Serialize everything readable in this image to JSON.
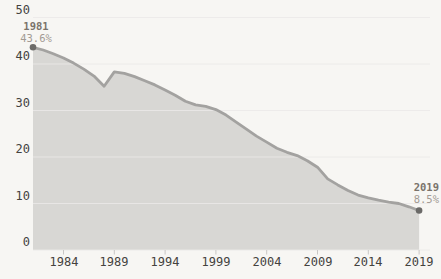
{
  "chart_data": {
    "type": "area",
    "x": [
      1981,
      1982,
      1983,
      1984,
      1985,
      1986,
      1987,
      1988,
      1989,
      1990,
      1991,
      1992,
      1993,
      1994,
      1995,
      1996,
      1997,
      1998,
      1999,
      2000,
      2001,
      2002,
      2003,
      2004,
      2005,
      2006,
      2007,
      2008,
      2009,
      2010,
      2011,
      2012,
      2013,
      2014,
      2015,
      2016,
      2017,
      2018,
      2019
    ],
    "values": [
      43.6,
      43.0,
      42.2,
      41.3,
      40.2,
      38.9,
      37.4,
      35.2,
      38.3,
      38.0,
      37.3,
      36.4,
      35.5,
      34.4,
      33.3,
      32.0,
      31.2,
      30.9,
      30.2,
      29.0,
      27.5,
      26.0,
      24.5,
      23.2,
      21.9,
      21.0,
      20.3,
      19.2,
      17.8,
      15.3,
      14.0,
      12.8,
      11.8,
      11.2,
      10.7,
      10.3,
      10.0,
      9.3,
      8.5
    ],
    "title": "",
    "xlabel": "",
    "ylabel": "",
    "ylim": [
      0,
      50
    ],
    "yticks": [
      0,
      10,
      20,
      30,
      40,
      50
    ],
    "xticks": [
      1984,
      1989,
      1994,
      1999,
      2004,
      2009,
      2014,
      2019
    ],
    "grid": "horizontal",
    "legend": "none",
    "annotations": [
      {
        "year": 1981,
        "label": "1981",
        "value_label": "43.6%"
      },
      {
        "year": 2019,
        "label": "2019",
        "value_label": "8.5%"
      }
    ],
    "colors": {
      "background": "#f7f6f3",
      "area_fill": "#d8d7d4",
      "line": "#a3a2a0",
      "marker": "#6b6a68",
      "grid": "#ebe9e7",
      "axis_tick": "#c9c7c5",
      "tick_label": "#44423e",
      "annotation_year": "#7a736b",
      "annotation_value": "#a39b93"
    }
  }
}
